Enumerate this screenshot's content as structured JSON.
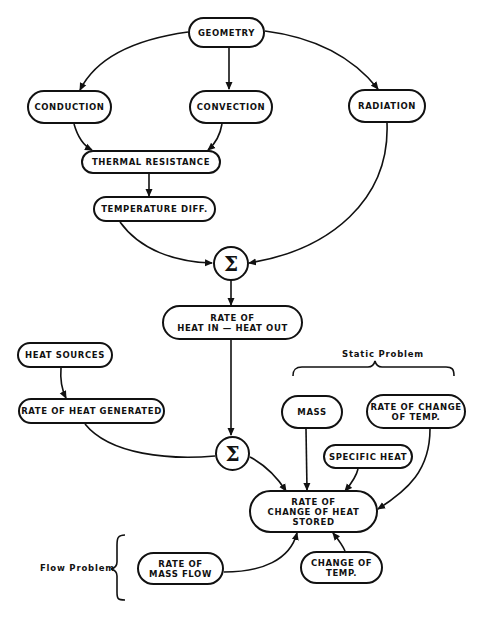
{
  "diagram": {
    "nodes": {
      "geometry": "GEOMETRY",
      "conduction": "CONDUCTION",
      "convection": "CONVECTION",
      "radiation": "RADIATION",
      "thermal_resistance": "THERMAL   RESISTANCE",
      "temperature_diff": "TEMPERATURE  DIFF.",
      "sum_1": "Σ",
      "rate_heat_in_out": "RATE  OF\nHEAT  IN  —  HEAT  OUT",
      "heat_sources": "HEAT  SOURCES",
      "rate_heat_generated": "RATE  OF  HEAT GENERATED",
      "sum_2": "Σ",
      "mass": "MASS",
      "rate_change_temp": "RATE  OF  CHANGE\nOF  TEMP.",
      "specific_heat": "SPECIFIC  HEAT",
      "rate_change_heat_stored": "RATE  OF\nCHANGE  OF  HEAT\nSTORED",
      "rate_mass_flow": "RATE  OF\nMASS  FLOW",
      "change_of_temp": "CHANGE  OF\nTEMP."
    },
    "annotations": {
      "static_problem": "Static  Problem",
      "flow_problem": "Flow   Problem"
    },
    "edges": [
      [
        "geometry",
        "conduction"
      ],
      [
        "geometry",
        "convection"
      ],
      [
        "geometry",
        "radiation"
      ],
      [
        "conduction",
        "thermal_resistance"
      ],
      [
        "convection",
        "thermal_resistance"
      ],
      [
        "thermal_resistance",
        "temperature_diff"
      ],
      [
        "temperature_diff",
        "sum_1"
      ],
      [
        "radiation",
        "sum_1"
      ],
      [
        "sum_1",
        "rate_heat_in_out"
      ],
      [
        "rate_heat_in_out",
        "sum_2"
      ],
      [
        "heat_sources",
        "rate_heat_generated"
      ],
      [
        "rate_heat_generated",
        "sum_2"
      ],
      [
        "sum_2",
        "rate_change_heat_stored"
      ],
      [
        "mass",
        "rate_change_heat_stored"
      ],
      [
        "specific_heat",
        "rate_change_heat_stored"
      ],
      [
        "rate_change_temp",
        "rate_change_heat_stored"
      ],
      [
        "rate_mass_flow",
        "rate_change_heat_stored"
      ],
      [
        "change_of_temp",
        "rate_change_heat_stored"
      ]
    ]
  }
}
